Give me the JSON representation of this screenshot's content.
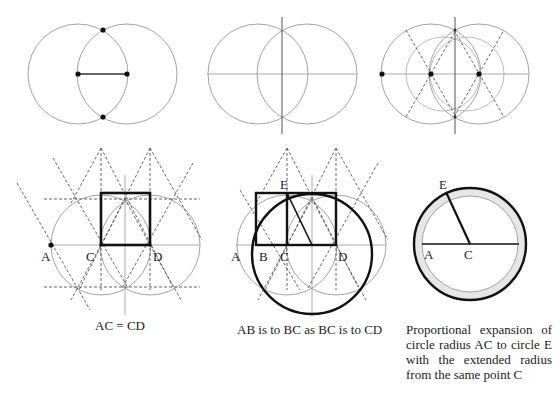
{
  "figures": {
    "top_row": [
      {
        "id": "vesica-basic",
        "description": "Two equal intersecting circles with segment joining centers and intersection points marked"
      },
      {
        "id": "vesica-axes",
        "description": "Two intersecting circles with horizontal axis and vertical bisector"
      },
      {
        "id": "vesica-hexagon",
        "description": "Two circles with dashed 60-degree construction lines and marked points"
      }
    ],
    "bottom_row": [
      {
        "id": "square-construction",
        "labels": {
          "a": "A",
          "c": "C",
          "d": "D"
        },
        "caption": "AC = CD"
      },
      {
        "id": "golden-ratio-construction",
        "labels": {
          "a": "A",
          "b": "B",
          "c": "C",
          "d": "D",
          "e": "E"
        },
        "caption": "AB  is to BC as BC is to CD"
      },
      {
        "id": "proportional-expansion",
        "labels": {
          "e": "E",
          "a": "A",
          "c": "C"
        },
        "caption": "Proportional expansion of circle radius AC to circle E with the extended radius from the same point C"
      }
    ]
  },
  "colors": {
    "thin_line": "#999999",
    "dashed_line": "#555555",
    "bold_line": "#1a1a1a",
    "ring_fill": "#e6e6e6",
    "background": "#ffffff"
  }
}
